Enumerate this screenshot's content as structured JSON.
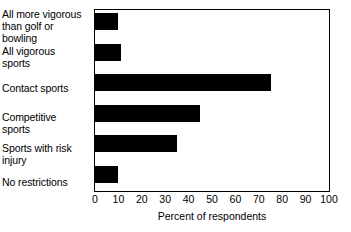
{
  "chart_data": {
    "type": "bar",
    "orientation": "horizontal",
    "title": "",
    "xlabel": "Percent of respondents",
    "ylabel": "",
    "xlim": [
      0,
      100
    ],
    "xticks": [
      0,
      10,
      20,
      30,
      40,
      50,
      60,
      70,
      80,
      90,
      100
    ],
    "grid": false,
    "legend": false,
    "bar_color": "#000000",
    "frame_color": "#000000",
    "background": "#ffffff",
    "categories": [
      "All more vigorous than golf or bowling",
      "All vigorous sports",
      "Contact sports",
      "Competitive sports",
      "Sports with risk injury",
      "No restrictions"
    ],
    "values": [
      10,
      11,
      75,
      45,
      35,
      10
    ]
  },
  "category_label_lines": [
    [
      "All more vigorous",
      "than golf or",
      "bowling"
    ],
    [
      "All vigorous",
      "sports"
    ],
    [
      "Contact sports"
    ],
    [
      "Competitive",
      "sports"
    ],
    [
      "Sports with risk",
      "injury"
    ],
    [
      "No restrictions"
    ]
  ]
}
